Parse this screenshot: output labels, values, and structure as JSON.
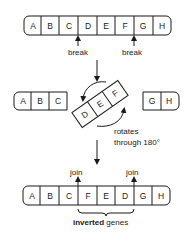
{
  "diagram": {
    "top_chromosome": {
      "genes": [
        "A",
        "B",
        "C",
        "D",
        "E",
        "F",
        "G",
        "H"
      ],
      "break_labels": [
        "break",
        "break"
      ]
    },
    "middle": {
      "left_fragment": [
        "A",
        "B",
        "C"
      ],
      "rotating_fragment": [
        "D",
        "E",
        "F"
      ],
      "right_fragment": [
        "G",
        "H"
      ],
      "rotation_label_line1": "rotates",
      "rotation_label_line2": "through 180°"
    },
    "bottom_chromosome": {
      "genes": [
        "A",
        "B",
        "C",
        "F",
        "E",
        "D",
        "G",
        "H"
      ],
      "join_labels": [
        "join",
        "join"
      ],
      "caption_bold": "inverted",
      "caption_rest": " genes"
    }
  }
}
